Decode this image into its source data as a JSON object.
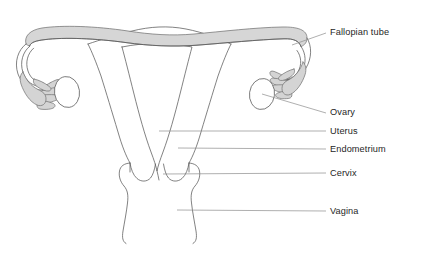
{
  "diagram": {
    "background_color": "#ffffff",
    "outline_color": "#585858",
    "fill_gray": "#d6d6d6",
    "leader_color": "#8c8c8c",
    "text_color": "#262626"
  },
  "labels": [
    {
      "id": "fallopian-tube",
      "text": "Fallopian tube",
      "x": 330,
      "y": 35
    },
    {
      "id": "ovary",
      "text": "Ovary",
      "x": 330,
      "y": 113
    },
    {
      "id": "uterus",
      "text": "Uterus",
      "x": 330,
      "y": 133
    },
    {
      "id": "endometrium",
      "text": "Endometrium",
      "x": 330,
      "y": 151
    },
    {
      "id": "cervix",
      "text": "Cervix",
      "x": 330,
      "y": 175
    },
    {
      "id": "vagina",
      "text": "Vagina",
      "x": 330,
      "y": 213
    }
  ],
  "structures": [
    {
      "id": "fallopian-tube",
      "name": "Fallopian tube"
    },
    {
      "id": "fimbriae-left",
      "name": "Fimbriae (left)"
    },
    {
      "id": "fimbriae-right",
      "name": "Fimbriae (right)"
    },
    {
      "id": "ovary-left",
      "name": "Ovary (left)"
    },
    {
      "id": "ovary-right",
      "name": "Ovary (right)"
    },
    {
      "id": "uterus",
      "name": "Uterus"
    },
    {
      "id": "endometrium",
      "name": "Endometrium"
    },
    {
      "id": "cervix",
      "name": "Cervix"
    },
    {
      "id": "vagina",
      "name": "Vagina"
    }
  ]
}
